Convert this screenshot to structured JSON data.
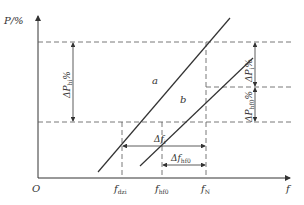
{
  "diagram": {
    "axes": {
      "y_label": "P/%",
      "x_label": "f",
      "origin": "O"
    },
    "lines": {
      "a": "a",
      "b": "b"
    },
    "x_ticks": [
      {
        "main": "f",
        "sub": "dzi"
      },
      {
        "main": "f",
        "sub": "hf0"
      },
      {
        "main": "f",
        "sub": "N"
      }
    ],
    "intervals": {
      "delta_f_i": {
        "main": "Δf",
        "sub": "i"
      },
      "delta_f_hf0": {
        "main": "Δf",
        "sub": "hf0"
      },
      "delta_P_hi": {
        "main": "ΔP",
        "sub": "hi",
        "suffix": "%"
      },
      "delta_P_i": {
        "main": "ΔP",
        "sub": "i",
        "suffix": "%"
      },
      "delta_P_hf0": {
        "main": "ΔP",
        "sub": "hf0",
        "suffix": "%"
      }
    },
    "colors": {
      "line": "#333333",
      "dashed": "#555555"
    }
  }
}
